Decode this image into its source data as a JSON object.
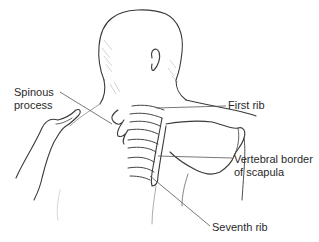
{
  "figure": {
    "colors": {
      "line": "#3a3a3a",
      "shading": "#9a9a9a",
      "leader": "#555555",
      "background": "#ffffff"
    }
  },
  "labels": {
    "spinous_process": [
      "Spinous",
      "process"
    ],
    "first_rib": "First rib",
    "vertebral_border": [
      "Vertebral border",
      "of scapula"
    ],
    "seventh_rib": "Seventh rib"
  }
}
